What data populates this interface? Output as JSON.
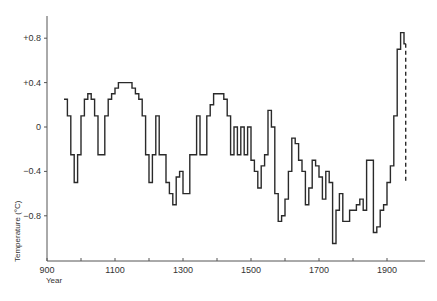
{
  "chart_data": {
    "type": "line",
    "style": "step",
    "title": "",
    "xlabel": "Year",
    "ylabel": "Temperature (°C)",
    "xlim": [
      900,
      2000
    ],
    "ylim": [
      -1.2,
      1.0
    ],
    "x_ticks": [
      900,
      1000,
      1100,
      1200,
      1300,
      1400,
      1500,
      1600,
      1700,
      1800,
      1900
    ],
    "x_tick_labels": [
      "900",
      "",
      "1100",
      "",
      "1300",
      "",
      "1500",
      "",
      "1700",
      "",
      "1900"
    ],
    "y_ticks": [
      0.8,
      0.4,
      0,
      -0.4,
      -0.8
    ],
    "y_tick_labels": [
      "+0.8",
      "+0.4",
      "0",
      "−0.4",
      "−0.8"
    ],
    "grid": false,
    "legend": null,
    "series": [
      {
        "name": "Temperature anomaly",
        "line_color": "#2a2a2a",
        "points": [
          [
            950,
            0.25
          ],
          [
            960,
            0.1
          ],
          [
            970,
            -0.25
          ],
          [
            980,
            -0.5
          ],
          [
            990,
            -0.25
          ],
          [
            1000,
            0.1
          ],
          [
            1010,
            0.25
          ],
          [
            1020,
            0.3
          ],
          [
            1030,
            0.25
          ],
          [
            1040,
            0.1
          ],
          [
            1050,
            -0.25
          ],
          [
            1060,
            -0.25
          ],
          [
            1070,
            0.1
          ],
          [
            1080,
            0.25
          ],
          [
            1090,
            0.3
          ],
          [
            1100,
            0.35
          ],
          [
            1110,
            0.4
          ],
          [
            1120,
            0.4
          ],
          [
            1130,
            0.4
          ],
          [
            1140,
            0.4
          ],
          [
            1150,
            0.35
          ],
          [
            1160,
            0.3
          ],
          [
            1170,
            0.25
          ],
          [
            1180,
            0.1
          ],
          [
            1190,
            -0.25
          ],
          [
            1200,
            -0.5
          ],
          [
            1210,
            -0.25
          ],
          [
            1220,
            0.1
          ],
          [
            1230,
            -0.25
          ],
          [
            1240,
            -0.25
          ],
          [
            1250,
            -0.5
          ],
          [
            1260,
            -0.6
          ],
          [
            1270,
            -0.7
          ],
          [
            1280,
            -0.45
          ],
          [
            1290,
            -0.4
          ],
          [
            1300,
            -0.6
          ],
          [
            1310,
            -0.6
          ],
          [
            1320,
            -0.25
          ],
          [
            1330,
            -0.25
          ],
          [
            1340,
            0.1
          ],
          [
            1350,
            -0.25
          ],
          [
            1360,
            -0.25
          ],
          [
            1370,
            0.1
          ],
          [
            1380,
            0.2
          ],
          [
            1390,
            0.3
          ],
          [
            1400,
            0.3
          ],
          [
            1410,
            0.3
          ],
          [
            1420,
            0.25
          ],
          [
            1430,
            0.1
          ],
          [
            1440,
            -0.25
          ],
          [
            1450,
            0.0
          ],
          [
            1460,
            -0.25
          ],
          [
            1470,
            0.0
          ],
          [
            1480,
            -0.25
          ],
          [
            1490,
            0.0
          ],
          [
            1500,
            -0.3
          ],
          [
            1510,
            -0.4
          ],
          [
            1520,
            -0.55
          ],
          [
            1530,
            -0.35
          ],
          [
            1540,
            -0.25
          ],
          [
            1550,
            0.15
          ],
          [
            1560,
            0.0
          ],
          [
            1570,
            -0.6
          ],
          [
            1580,
            -0.85
          ],
          [
            1590,
            -0.8
          ],
          [
            1600,
            -0.65
          ],
          [
            1610,
            -0.4
          ],
          [
            1620,
            -0.1
          ],
          [
            1630,
            -0.15
          ],
          [
            1640,
            -0.3
          ],
          [
            1650,
            -0.4
          ],
          [
            1660,
            -0.7
          ],
          [
            1670,
            -0.55
          ],
          [
            1680,
            -0.3
          ],
          [
            1690,
            -0.35
          ],
          [
            1700,
            -0.45
          ],
          [
            1710,
            -0.65
          ],
          [
            1720,
            -0.4
          ],
          [
            1730,
            -0.5
          ],
          [
            1740,
            -1.05
          ],
          [
            1750,
            -0.75
          ],
          [
            1760,
            -0.6
          ],
          [
            1770,
            -0.85
          ],
          [
            1780,
            -0.85
          ],
          [
            1790,
            -0.75
          ],
          [
            1800,
            -0.75
          ],
          [
            1810,
            -0.7
          ],
          [
            1820,
            -0.65
          ],
          [
            1830,
            -0.75
          ],
          [
            1840,
            -0.3
          ],
          [
            1850,
            -0.3
          ],
          [
            1860,
            -0.95
          ],
          [
            1870,
            -0.9
          ],
          [
            1880,
            -0.75
          ],
          [
            1890,
            -0.7
          ],
          [
            1900,
            -0.5
          ],
          [
            1910,
            -0.35
          ],
          [
            1920,
            0.1
          ],
          [
            1930,
            0.7
          ],
          [
            1940,
            0.85
          ],
          [
            1950,
            0.75
          ],
          [
            1955,
            0.75
          ]
        ],
        "dashed_tail": {
          "x": 1955,
          "from": 0.75,
          "to": -0.5
        }
      }
    ]
  }
}
